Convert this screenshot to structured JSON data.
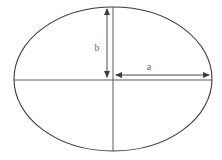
{
  "figure": {
    "type": "geometry-diagram",
    "background_color": "#ffffff",
    "width": 222,
    "height": 160
  },
  "ellipse": {
    "stroke_color": "#3a3a3a",
    "stroke_width": 1,
    "center_x": 113,
    "center_y": 79,
    "semi_major_axis_px": 99,
    "semi_minor_axis_px": 72
  },
  "axes": {
    "stroke_color": "#5a5a5a",
    "horizontal": {
      "name": "major-axis-line",
      "x1": 14,
      "y1": 80,
      "x2": 212,
      "y2": 80
    },
    "vertical": {
      "name": "minor-axis-line",
      "x1": 113,
      "y1": 7,
      "x2": 113,
      "y2": 151
    }
  },
  "measurements": [
    {
      "id": "semi-minor",
      "label": "b",
      "orientation": "vertical",
      "label_x": 97,
      "label_y": 51,
      "arrow": {
        "x1": 107,
        "y1": 9,
        "x2": 107,
        "y2": 77
      },
      "arrowheads": [
        "start",
        "end"
      ],
      "stroke_color": "#4a4a4a"
    },
    {
      "id": "semi-major",
      "label": "a",
      "orientation": "horizontal",
      "label_x": 149,
      "label_y": 70,
      "arrow": {
        "x1": 116,
        "y1": 75,
        "x2": 209,
        "y2": 75
      },
      "arrowheads": [
        "start",
        "end"
      ],
      "stroke_color": "#4a4a4a"
    }
  ],
  "chart_data": {
    "type": "diagram",
    "title": "",
    "labels": [
      "b",
      "a"
    ]
  }
}
